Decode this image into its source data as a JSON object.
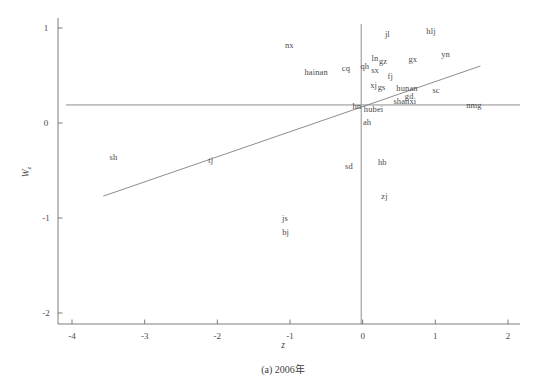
{
  "chart_data": {
    "type": "scatter",
    "title": "",
    "caption": "(a) 2006年",
    "xlabel": "z",
    "ylabel": "W",
    "ylabel_sub": "z",
    "xlim": [
      -4,
      2
    ],
    "ylim": [
      -2,
      1
    ],
    "xticks": [
      "-4",
      "-3",
      "-2",
      "-1",
      "0",
      "1",
      "2"
    ],
    "xtick_values": [
      -4,
      -3,
      -2,
      -1,
      0,
      1,
      2
    ],
    "yticks": [
      "1",
      "0",
      "-1",
      "-2"
    ],
    "ytick_values": [
      1,
      0,
      -1,
      -2
    ],
    "grid": false,
    "legend": "none",
    "reference_lines": [
      {
        "name": "mean-horizontal-line",
        "orientation": "horizontal",
        "y": 0.19
      },
      {
        "name": "mean-vertical-line",
        "orientation": "vertical",
        "x": -0.02
      },
      {
        "name": "regression-line",
        "orientation": "diagonal",
        "x1": -3.57,
        "y1": -0.77,
        "x2": 1.62,
        "y2": 0.6
      }
    ],
    "point_labels": [
      {
        "label": "nx",
        "x": -1.01,
        "y": 0.82
      },
      {
        "label": "jl",
        "x": 0.34,
        "y": 0.94
      },
      {
        "label": "hlj",
        "x": 0.94,
        "y": 0.97
      },
      {
        "label": "hainan",
        "x": -0.64,
        "y": 0.54
      },
      {
        "label": "cq",
        "x": -0.23,
        "y": 0.58
      },
      {
        "label": "qh",
        "x": 0.03,
        "y": 0.6
      },
      {
        "label": "ln",
        "x": 0.17,
        "y": 0.68
      },
      {
        "label": "gz",
        "x": 0.28,
        "y": 0.65
      },
      {
        "label": "sx",
        "x": 0.17,
        "y": 0.56
      },
      {
        "label": "fj",
        "x": 0.38,
        "y": 0.5
      },
      {
        "label": "gx",
        "x": 0.69,
        "y": 0.67
      },
      {
        "label": "yn",
        "x": 1.14,
        "y": 0.73
      },
      {
        "label": "xj",
        "x": 0.15,
        "y": 0.4
      },
      {
        "label": "gs",
        "x": 0.26,
        "y": 0.38
      },
      {
        "label": "hunan",
        "x": 0.61,
        "y": 0.37
      },
      {
        "label": "sc",
        "x": 1.01,
        "y": 0.35
      },
      {
        "label": "gd",
        "x": 0.64,
        "y": 0.28
      },
      {
        "label": "shanxi",
        "x": 0.58,
        "y": 0.23
      },
      {
        "label": "hn",
        "x": -0.08,
        "y": 0.18
      },
      {
        "label": "hubei",
        "x": 0.15,
        "y": 0.15
      },
      {
        "label": "nmg",
        "x": 1.53,
        "y": 0.19
      },
      {
        "label": "ah",
        "x": 0.06,
        "y": 0.01
      },
      {
        "label": "hb",
        "x": 0.27,
        "y": -0.41
      },
      {
        "label": "sd",
        "x": -0.19,
        "y": -0.45
      },
      {
        "label": "sh",
        "x": -3.43,
        "y": -0.36
      },
      {
        "label": "tj",
        "x": -2.09,
        "y": -0.39
      },
      {
        "label": "zj",
        "x": 0.3,
        "y": -0.77
      },
      {
        "label": "js",
        "x": -1.07,
        "y": -1.0
      },
      {
        "label": "bj",
        "x": -1.06,
        "y": -1.15
      }
    ]
  },
  "colors": {
    "axis": "#6e6e6e",
    "line": "#808080",
    "text": "#4a4a4a",
    "background": "#ffffff"
  }
}
